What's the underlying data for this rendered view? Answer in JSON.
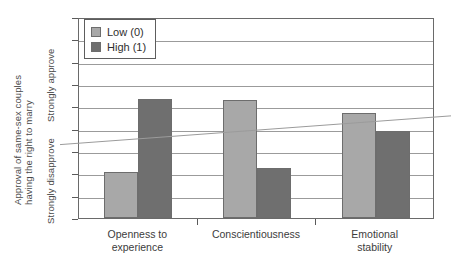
{
  "chart_data": {
    "type": "bar",
    "title": "",
    "xlabel": "",
    "ylabel": "Approval of same-sex couples having the right to marry",
    "ylabel_line1": "Approval of same-sex couples",
    "ylabel_line2": "having the right to marry",
    "y_endpoint_high": "Strongly approve",
    "y_endpoint_low": "Strongly disapprove",
    "ylim": [
      1,
      10
    ],
    "yticks": [
      1,
      2,
      3,
      4,
      5,
      6,
      7,
      8,
      9,
      10
    ],
    "ytick_labels": [
      "1",
      "2",
      "3",
      "4",
      "5",
      "6",
      "7",
      "8",
      "9",
      "10"
    ],
    "grid": true,
    "legend_position": "top-left",
    "categories": [
      "Openness to experience",
      "Conscientiousness",
      "Emotional stability"
    ],
    "category_lines": [
      [
        "Openness to",
        "experience"
      ],
      [
        "Conscientiousness",
        ""
      ],
      [
        "Emotional",
        "stability"
      ]
    ],
    "series": [
      {
        "name": "Low (0)",
        "color": "#a8a8a8",
        "values": [
          3.05,
          6.3,
          5.7
        ]
      },
      {
        "name": "High (1)",
        "color": "#6f6f6f",
        "values": [
          6.35,
          3.25,
          4.9
        ]
      }
    ],
    "trend_line": {
      "name": "trend",
      "color": "#9b9b9b",
      "y_start": 4.6,
      "y_end": 5.35
    }
  },
  "legend": {
    "items": [
      {
        "label": "Low (0)"
      },
      {
        "label": "High (1)"
      }
    ]
  }
}
